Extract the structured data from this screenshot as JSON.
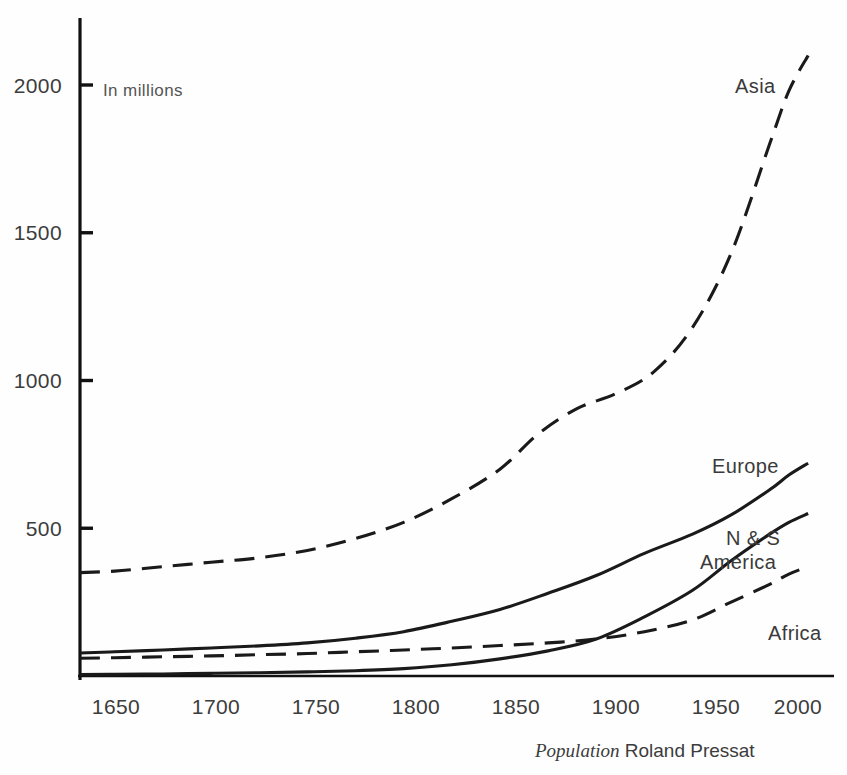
{
  "figure": {
    "unit_note": "In millions",
    "credit_italic": "Population",
    "credit_roman": "Roland Pressat"
  },
  "axes": {
    "y_ticks": [
      "500",
      "1000",
      "1500",
      "2000"
    ],
    "x_ticks": [
      "1650",
      "1700",
      "1750",
      "1800",
      "1850",
      "1900",
      "1950",
      "2000"
    ]
  },
  "series_labels": {
    "asia": "Asia",
    "europe": "Europe",
    "america_line1": "N & S",
    "america_line2": "America",
    "africa": "Africa"
  },
  "chart_data": {
    "type": "line",
    "title": "",
    "subtitle": "",
    "xlabel": "",
    "ylabel": "In millions",
    "xlim": [
      1632,
      2012
    ],
    "ylim": [
      0,
      2150
    ],
    "grid": false,
    "legend": "inline-labels-at-curve-ends",
    "y_tick_values": [
      500,
      1000,
      1500,
      2000
    ],
    "x_tick_values": [
      1650,
      1700,
      1750,
      1800,
      1850,
      1900,
      1950,
      2000
    ],
    "annotations": [
      {
        "text": "In millions",
        "x": 1668,
        "y": 2000
      },
      {
        "text": "Population Roland Pressat",
        "x": 1930,
        "y": -210
      }
    ],
    "series": [
      {
        "name": "Asia",
        "style": "dashed",
        "color": "#1a1a1a",
        "x": [
          1632,
          1650,
          1675,
          1700,
          1725,
          1750,
          1775,
          1800,
          1825,
          1850,
          1870,
          1890,
          1910,
          1930,
          1950,
          1970,
          1990,
          2000,
          2010
        ],
        "values": [
          350,
          355,
          370,
          385,
          400,
          425,
          465,
          520,
          600,
          700,
          820,
          905,
          955,
          1030,
          1180,
          1430,
          1800,
          1980,
          2100
        ]
      },
      {
        "name": "Europe",
        "style": "solid",
        "color": "#1a1a1a",
        "x": [
          1632,
          1650,
          1675,
          1700,
          1725,
          1750,
          1775,
          1800,
          1825,
          1850,
          1875,
          1900,
          1925,
          1950,
          1970,
          1990,
          2000,
          2010
        ],
        "values": [
          78,
          82,
          88,
          95,
          102,
          112,
          128,
          150,
          185,
          225,
          280,
          340,
          415,
          480,
          545,
          630,
          680,
          720
        ]
      },
      {
        "name": "N & S America",
        "style": "solid",
        "color": "#1a1a1a",
        "x": [
          1632,
          1650,
          1675,
          1700,
          1725,
          1750,
          1775,
          1800,
          1825,
          1850,
          1875,
          1900,
          1925,
          1950,
          1970,
          1990,
          2000,
          2010
        ],
        "values": [
          5,
          6,
          7,
          9,
          11,
          14,
          18,
          25,
          38,
          58,
          85,
          125,
          200,
          290,
          390,
          480,
          520,
          550
        ]
      },
      {
        "name": "Africa",
        "style": "dashed",
        "color": "#1a1a1a",
        "x": [
          1632,
          1650,
          1675,
          1700,
          1725,
          1750,
          1775,
          1800,
          1825,
          1850,
          1875,
          1900,
          1925,
          1950,
          1970,
          1990,
          2000,
          2010
        ],
        "values": [
          60,
          62,
          65,
          68,
          72,
          76,
          82,
          88,
          95,
          103,
          112,
          125,
          150,
          190,
          250,
          310,
          345,
          370
        ]
      }
    ]
  }
}
